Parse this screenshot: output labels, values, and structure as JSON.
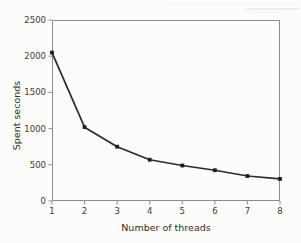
{
  "figure": {
    "background_color": "#fcfcfa",
    "frame_color": "#8d8d8d",
    "line_color": "#2b2b2b",
    "marker_color": "#1f1f1f",
    "text_color": "#3b3b3b"
  },
  "chart_data": {
    "type": "line",
    "title": "",
    "xlabel": "Number of threads",
    "ylabel": "Spent seconds",
    "x": [
      1,
      2,
      3,
      4,
      5,
      6,
      7,
      8
    ],
    "values": [
      2050,
      1020,
      750,
      570,
      490,
      425,
      345,
      305
    ],
    "series": [
      {
        "name": "Spent seconds",
        "x": [
          1,
          2,
          3,
          4,
          5,
          6,
          7,
          8
        ],
        "values": [
          2050,
          1020,
          750,
          570,
          490,
          425,
          345,
          305
        ]
      }
    ],
    "xlim": [
      1,
      8
    ],
    "ylim": [
      0,
      2500
    ],
    "xticks": [
      1,
      2,
      3,
      4,
      5,
      6,
      7,
      8
    ],
    "yticks": [
      0,
      500,
      1000,
      1500,
      2000,
      2500
    ],
    "xtick_labels": [
      "1",
      "2",
      "3",
      "4",
      "5",
      "6",
      "7",
      "8"
    ],
    "ytick_labels": [
      "0",
      "500",
      "1000",
      "1500",
      "2000",
      "2500"
    ],
    "grid": false,
    "legend": null,
    "marker": "square",
    "annotations": []
  }
}
